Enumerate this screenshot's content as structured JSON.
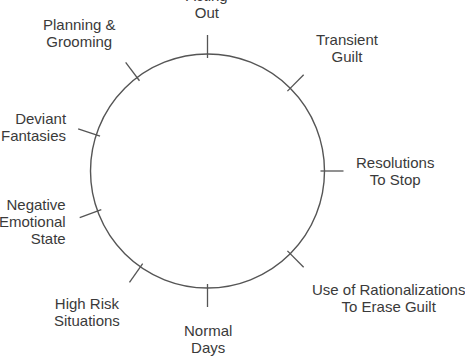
{
  "caption": {
    "fragment_text": "this form:"
  },
  "diagram": {
    "type": "cycle-wheel",
    "shape": "circle",
    "stroke_color": "#555555",
    "text_color": "#3a3a3a",
    "background_color": "#ffffff",
    "center_x": 207.5,
    "center_y": 171,
    "radius": 117,
    "nodes": [
      {
        "id": "acting-out",
        "label": "Acting\nOut",
        "label_lines": [
          "Acting",
          "Out"
        ],
        "angle_deg": 270,
        "order": 1,
        "align": "center"
      },
      {
        "id": "transient-guilt",
        "label": "Transient\nGuilt",
        "label_lines": [
          "Transient",
          "Guilt"
        ],
        "angle_deg": 315,
        "order": 2,
        "align": "center"
      },
      {
        "id": "resolutions-to-stop",
        "label": "Resolutions\nTo Stop",
        "label_lines": [
          "Resolutions",
          "To Stop"
        ],
        "angle_deg": 0,
        "order": 3,
        "align": "center"
      },
      {
        "id": "use-of-rationalizations-to-erase-guilt",
        "label": "Use of Rationalizations\nTo Erase Guilt",
        "label_lines": [
          "Use of Rationalizations",
          "To Erase Guilt"
        ],
        "angle_deg": 45,
        "order": 4,
        "align": "center"
      },
      {
        "id": "normal-days",
        "label": "Normal\nDays",
        "label_lines": [
          "Normal",
          "Days"
        ],
        "angle_deg": 90,
        "order": 5,
        "align": "center"
      },
      {
        "id": "high-risk-situations",
        "label": "High Risk\nSituations",
        "label_lines": [
          "High Risk",
          "Situations"
        ],
        "angle_deg": 125,
        "order": 6,
        "align": "center"
      },
      {
        "id": "negative-emotional-state",
        "label": "Negative\nEmotional\nState",
        "label_lines": [
          "Negative",
          "Emotional",
          "State"
        ],
        "angle_deg": 160,
        "order": 7,
        "align": "right"
      },
      {
        "id": "deviant-fantasies",
        "label": "Deviant\nFantasies",
        "label_lines": [
          "Deviant",
          "Fantasies"
        ],
        "angle_deg": 198,
        "order": 8,
        "align": "right"
      },
      {
        "id": "planning-and-grooming",
        "label": "Planning &\nGrooming",
        "label_lines": [
          "Planning &",
          "Grooming"
        ],
        "angle_deg": 233,
        "order": 9,
        "align": "center"
      }
    ]
  }
}
